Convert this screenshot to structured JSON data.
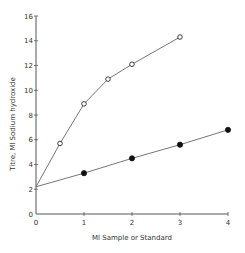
{
  "chart_data": {
    "type": "line",
    "title": "",
    "xlabel": "Ml Sample or Standard",
    "ylabel": "Titre, Ml Sodium hydroxide",
    "xlim": [
      0,
      4
    ],
    "ylim": [
      0,
      16
    ],
    "xticks": [
      0,
      1,
      2,
      3,
      4
    ],
    "yticks": [
      0,
      2,
      4,
      6,
      8,
      10,
      12,
      14,
      16
    ],
    "grid": false,
    "legend": null,
    "series": [
      {
        "name": "open-circles",
        "marker": "open-circle",
        "line_start": [
          0,
          2.2
        ],
        "x": [
          0.5,
          1,
          1.5,
          2,
          3
        ],
        "y": [
          5.7,
          8.9,
          10.9,
          12.1,
          14.3
        ]
      },
      {
        "name": "filled-circles",
        "marker": "filled-circle",
        "line_start": [
          0,
          2.2
        ],
        "x": [
          1,
          2,
          3,
          4
        ],
        "y": [
          3.3,
          4.5,
          5.6,
          6.8
        ]
      }
    ]
  },
  "colors": {
    "axis": "#555555",
    "line": "#666666",
    "marker": "#111111"
  }
}
